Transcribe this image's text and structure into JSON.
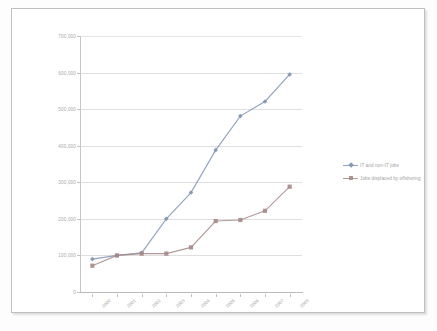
{
  "chart_data": {
    "type": "line",
    "title": "",
    "xlabel": "",
    "ylabel": "",
    "categories": [
      "2000",
      "2001",
      "2002",
      "2003",
      "2004",
      "2005",
      "2006",
      "2007",
      "2008"
    ],
    "ylim": [
      0,
      700000
    ],
    "ytick_labels": [
      "700,000",
      "600,000",
      "500,000",
      "400,000",
      "300,000",
      "200,000",
      "100,000",
      "0"
    ],
    "ytick_values": [
      700000,
      600000,
      500000,
      400000,
      300000,
      200000,
      100000,
      0
    ],
    "grid": true,
    "legend_position": "right",
    "series": [
      {
        "name": "IT and non-IT jobs",
        "color": "#7189a8",
        "marker": "diamond",
        "values": [
          90000,
          100000,
          107000,
          200000,
          272000,
          388000,
          481000,
          521000,
          595000
        ]
      },
      {
        "name": "Jobs displaced by offshoring",
        "color": "#9c7b7b",
        "marker": "square",
        "values": [
          72000,
          100000,
          105000,
          105000,
          122000,
          194000,
          197000,
          222000,
          288000
        ]
      }
    ]
  },
  "legend": {
    "items": [
      {
        "label": "IT and non-IT jobs"
      },
      {
        "label": "Jobs displaced by offshoring"
      }
    ]
  },
  "colors": {
    "series_1": "#7189a8",
    "series_2": "#9c7b7b",
    "gridline": "#dcdcdc",
    "axis": "#bdbdbd",
    "text": "#8e8e8e",
    "frame_border": "#b8b8b8"
  }
}
